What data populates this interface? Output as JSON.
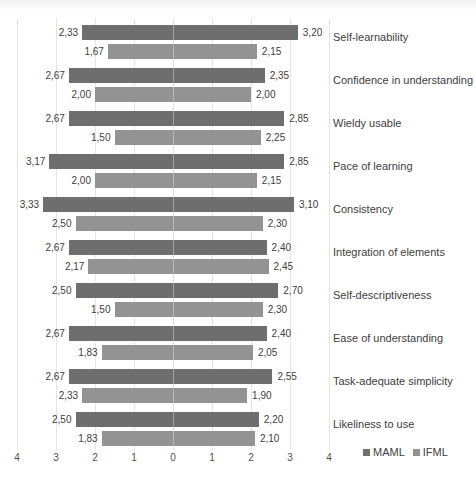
{
  "chart_data": {
    "type": "bar",
    "orientation": "horizontal-diverging",
    "title": "",
    "xlabel": "",
    "ylabel": "",
    "xlim": [
      -4,
      4
    ],
    "x_ticks": [
      "4",
      "3",
      "2",
      "1",
      "0",
      "1",
      "2",
      "3",
      "4"
    ],
    "grid": true,
    "legend_position": "bottom-right",
    "categories": [
      "Self-learnability",
      "Confidence in understanding",
      "Wieldy usable",
      "Pace of learning",
      "Consistency",
      "Integration of elements",
      "Self-descriptiveness",
      "Ease of understanding",
      "Task-adequate simplicity",
      "Likeliness to use"
    ],
    "series": [
      {
        "name": "MAML",
        "color": "#6e6e6e",
        "left_values": [
          2.33,
          2.67,
          2.67,
          3.17,
          3.33,
          2.67,
          2.5,
          2.67,
          2.67,
          2.5
        ],
        "right_values": [
          3.2,
          2.35,
          2.85,
          2.85,
          3.1,
          2.4,
          2.7,
          2.4,
          2.55,
          2.2
        ],
        "left_labels": [
          "2,33",
          "2,67",
          "2,67",
          "3,17",
          "3,33",
          "2,67",
          "2,50",
          "2,67",
          "2,67",
          "2,50"
        ],
        "right_labels": [
          "3,20",
          "2,35",
          "2,85",
          "2,85",
          "3,10",
          "2,40",
          "2,70",
          "2,40",
          "2,55",
          "2,20"
        ]
      },
      {
        "name": "IFML",
        "color": "#939393",
        "left_values": [
          1.67,
          2.0,
          1.5,
          2.0,
          2.5,
          2.17,
          1.5,
          1.83,
          2.33,
          1.83
        ],
        "right_values": [
          2.15,
          2.0,
          2.25,
          2.15,
          2.3,
          2.45,
          2.3,
          2.05,
          1.9,
          2.1
        ],
        "left_labels": [
          "1,67",
          "2,00",
          "1,50",
          "2,00",
          "2,50",
          "2,17",
          "1,50",
          "1,83",
          "2,33",
          "1,83"
        ],
        "right_labels": [
          "2,15",
          "2,00",
          "2,25",
          "2,15",
          "2,30",
          "2,45",
          "2,30",
          "2,05",
          "1,90",
          "2,10"
        ]
      }
    ]
  },
  "legend": {
    "items": [
      {
        "label": "MAML",
        "color": "#6e6e6e"
      },
      {
        "label": "IFML",
        "color": "#939393"
      }
    ]
  }
}
